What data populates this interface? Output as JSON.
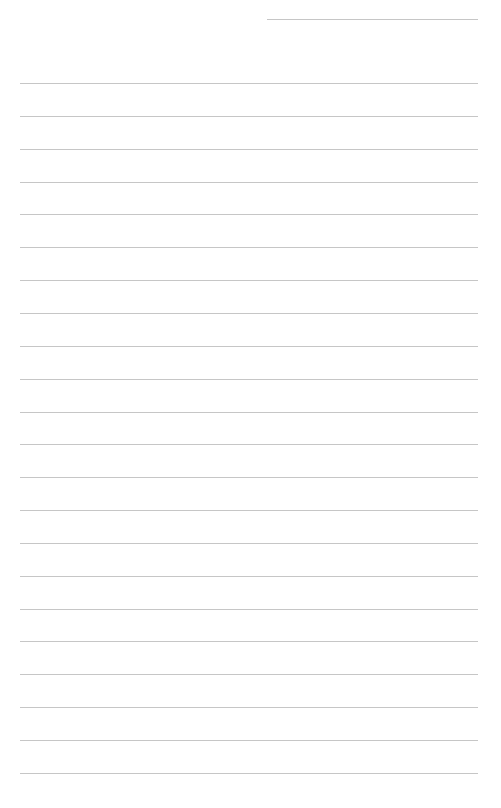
{
  "page": {
    "type": "blank-lined-sheet",
    "background_color": "#ffffff",
    "line_color": "#c6c6c6",
    "header_line": {
      "left": 267,
      "top": 19,
      "width": 211
    },
    "rules": {
      "count": 22,
      "left": 20,
      "width": 458,
      "first_top": 83,
      "spacing": 32.85
    }
  }
}
